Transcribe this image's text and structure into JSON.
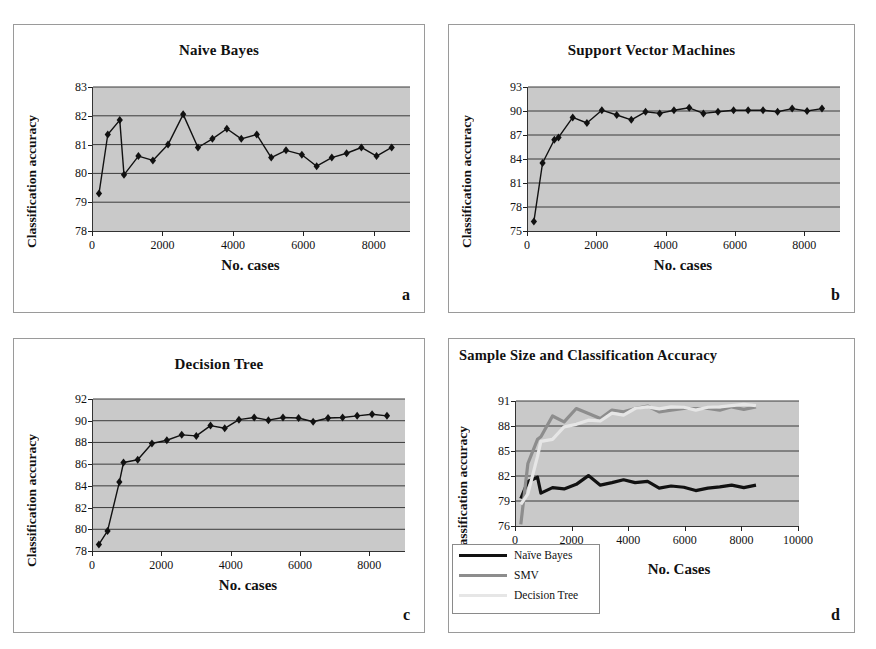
{
  "figure": {
    "ylabel": "Classification accuracy",
    "xlabel_lower": "No. cases",
    "xlabel_combined": "No. Cases",
    "letters": {
      "a": "a",
      "b": "b",
      "c": "c",
      "d": "d"
    },
    "colors": {
      "plot_background": "#c9c9c9",
      "gridline": "#3b3b3b",
      "axis": "#222222",
      "series_naive_bayes": "#111111",
      "series_svm": "#8d8d8d",
      "series_decision_tree": "#e2e2e2",
      "panel_border": "#9a9a9a"
    }
  },
  "chart_data": [
    {
      "id": "naive-bayes",
      "type": "line",
      "title": "Naive Bayes",
      "xlabel": "No. cases",
      "ylabel": "Classification accuracy",
      "xlim": [
        0,
        9000
      ],
      "ylim": [
        78,
        83
      ],
      "yticks": [
        78,
        79,
        80,
        81,
        82,
        83
      ],
      "xticks": [
        0,
        2000,
        4000,
        6000,
        8000
      ],
      "grid": true,
      "markers": "diamond",
      "legend": "none",
      "x": [
        170,
        420,
        760,
        880,
        1290,
        1700,
        2130,
        2560,
        2980,
        3390,
        3800,
        4210,
        4650,
        5060,
        5480,
        5930,
        6350,
        6780,
        7200,
        7620,
        8050,
        8480
      ],
      "values": [
        79.3,
        81.35,
        81.85,
        79.95,
        80.6,
        80.45,
        81.0,
        82.05,
        80.9,
        81.2,
        81.55,
        81.2,
        81.35,
        80.55,
        80.8,
        80.65,
        80.25,
        80.55,
        80.7,
        80.9,
        80.6,
        80.9
      ]
    },
    {
      "id": "support-vector-machines",
      "type": "line",
      "title": "Support Vector Machines",
      "xlabel": "No. cases",
      "ylabel": "Classification accuracy",
      "xlim": [
        0,
        9000
      ],
      "ylim": [
        75,
        93
      ],
      "yticks": [
        75,
        78,
        81,
        84,
        87,
        90,
        93
      ],
      "xticks": [
        0,
        2000,
        4000,
        6000,
        8000
      ],
      "grid": true,
      "markers": "diamond",
      "legend": "none",
      "x": [
        170,
        420,
        760,
        880,
        1290,
        1700,
        2130,
        2560,
        2980,
        3390,
        3800,
        4210,
        4650,
        5060,
        5480,
        5930,
        6350,
        6780,
        7200,
        7620,
        8050,
        8480
      ],
      "values": [
        76.2,
        83.5,
        86.4,
        86.7,
        89.2,
        88.5,
        90.1,
        89.5,
        88.9,
        89.9,
        89.7,
        90.1,
        90.4,
        89.7,
        89.9,
        90.1,
        90.1,
        90.1,
        89.9,
        90.3,
        90.0,
        90.3
      ]
    },
    {
      "id": "decision-tree",
      "type": "line",
      "title": "Decision Tree",
      "xlabel": "No. cases",
      "ylabel": "Classification accuracy",
      "xlim": [
        0,
        9000
      ],
      "ylim": [
        78,
        92
      ],
      "yticks": [
        78,
        80,
        82,
        84,
        86,
        88,
        90,
        92
      ],
      "xticks": [
        0,
        2000,
        4000,
        6000,
        8000
      ],
      "grid": true,
      "markers": "diamond",
      "legend": "none",
      "x": [
        170,
        420,
        760,
        880,
        1290,
        1700,
        2130,
        2560,
        2980,
        3390,
        3800,
        4210,
        4650,
        5060,
        5480,
        5930,
        6350,
        6780,
        7200,
        7620,
        8050,
        8480
      ],
      "values": [
        78.6,
        79.85,
        84.35,
        86.15,
        86.4,
        87.9,
        88.2,
        88.7,
        88.6,
        89.55,
        89.3,
        90.1,
        90.3,
        90.05,
        90.3,
        90.25,
        89.9,
        90.25,
        90.3,
        90.45,
        90.6,
        90.45
      ]
    },
    {
      "id": "sample-size-and-classification-accuracy",
      "type": "line",
      "title": "Sample Size and Classification Accuracy",
      "xlabel": "No. Cases",
      "ylabel": "Classification accuracy",
      "xlim": [
        0,
        10000
      ],
      "ylim": [
        76,
        91
      ],
      "yticks": [
        76,
        79,
        82,
        85,
        88,
        91
      ],
      "xticks": [
        0,
        2000,
        4000,
        6000,
        8000,
        10000
      ],
      "grid": true,
      "markers": "none",
      "legend_position": "bottom-left",
      "x": [
        170,
        420,
        760,
        880,
        1290,
        1700,
        2130,
        2560,
        2980,
        3390,
        3800,
        4210,
        4650,
        5060,
        5480,
        5930,
        6350,
        6780,
        7200,
        7620,
        8050,
        8480
      ],
      "series": [
        {
          "name": "Naïve Bayes",
          "color": "#111111",
          "width": 3.2,
          "values": [
            79.3,
            81.35,
            81.85,
            79.95,
            80.6,
            80.45,
            81.0,
            82.05,
            80.9,
            81.2,
            81.55,
            81.2,
            81.35,
            80.55,
            80.8,
            80.65,
            80.25,
            80.55,
            80.7,
            80.9,
            80.6,
            80.9
          ]
        },
        {
          "name": "SMV",
          "color": "#8d8d8d",
          "width": 3.2,
          "values": [
            76.2,
            83.5,
            86.4,
            86.7,
            89.2,
            88.5,
            90.1,
            89.5,
            88.9,
            89.9,
            89.7,
            90.1,
            90.4,
            89.7,
            89.9,
            90.1,
            90.1,
            90.1,
            89.9,
            90.3,
            90.0,
            90.3
          ]
        },
        {
          "name": "Decision Tree",
          "color": "#e6e6e6",
          "width": 3.2,
          "values": [
            78.6,
            79.85,
            84.35,
            86.15,
            86.4,
            87.9,
            88.2,
            88.7,
            88.6,
            89.55,
            89.3,
            90.1,
            90.3,
            90.05,
            90.3,
            90.25,
            89.9,
            90.25,
            90.3,
            90.45,
            90.6,
            90.45
          ]
        }
      ]
    }
  ]
}
